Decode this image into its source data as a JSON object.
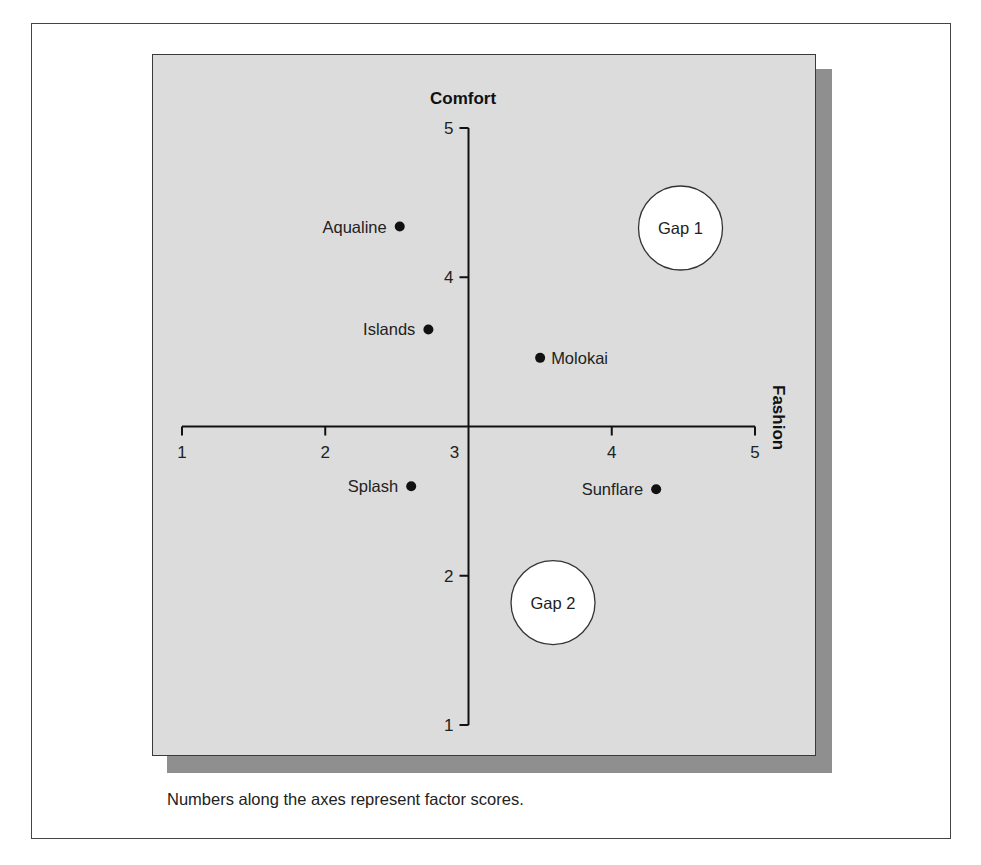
{
  "chart_data": {
    "type": "scatter",
    "title": "",
    "xlabel": "Fashion",
    "ylabel": "Comfort",
    "xlim": [
      1,
      5
    ],
    "ylim": [
      1,
      5
    ],
    "x_ticks": [
      "1",
      "2",
      "3",
      "4",
      "5"
    ],
    "y_ticks": [
      "1",
      "2",
      "4",
      "5"
    ],
    "axes_cross_at": [
      3,
      3
    ],
    "grid": false,
    "legend": null,
    "points": [
      {
        "label": "Aqualine",
        "x": 2.52,
        "y": 4.34
      },
      {
        "label": "Islands",
        "x": 2.72,
        "y": 3.65
      },
      {
        "label": "Molokai",
        "x": 3.5,
        "y": 3.46
      },
      {
        "label": "Splash",
        "x": 2.6,
        "y": 2.6
      },
      {
        "label": "Sunflare",
        "x": 4.31,
        "y": 2.58
      }
    ],
    "annotations": [
      {
        "label": "Gap 1",
        "x": 4.48,
        "y": 4.33,
        "shape": "circle"
      },
      {
        "label": "Gap 2",
        "x": 3.59,
        "y": 1.82,
        "shape": "circle"
      }
    ],
    "caption": "Numbers along the axes represent factor scores."
  },
  "colors": {
    "panel_bg": "#dcdcdc",
    "shadow": "#8f8f8f",
    "ink": "#111111",
    "gap_fill": "#ffffff"
  }
}
